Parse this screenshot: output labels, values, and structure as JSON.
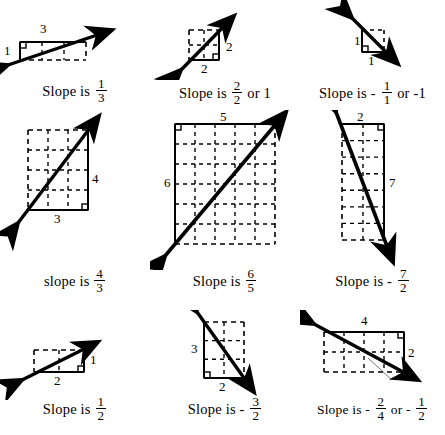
{
  "figures": [
    {
      "id": "slope-one-third",
      "caption_prefix": "Slope is",
      "sign": "",
      "numerator": "1",
      "denominator": "3",
      "alt_text": "",
      "rise_label": "1",
      "run_label": "3",
      "rise": 1,
      "run": 3,
      "direction": "positive",
      "grid_cols": 3,
      "grid_rows": 1
    },
    {
      "id": "slope-two-over-two",
      "caption_prefix": "Slope is",
      "sign": "",
      "numerator": "2",
      "denominator": "2",
      "alt_text": "or  1",
      "rise_label": "2",
      "run_label": "2",
      "rise": 2,
      "run": 2,
      "direction": "positive",
      "grid_cols": 2,
      "grid_rows": 2
    },
    {
      "id": "slope-negative-one",
      "caption_prefix": "Slope is",
      "sign": "-",
      "numerator": "1",
      "denominator": "1",
      "alt_text": "or  -1",
      "rise_label": "1",
      "run_label": "1",
      "rise": 1,
      "run": 1,
      "direction": "negative",
      "grid_cols": 1,
      "grid_rows": 1
    },
    {
      "id": "slope-four-thirds",
      "caption_prefix": "slope is",
      "sign": "",
      "numerator": "4",
      "denominator": "3",
      "alt_text": "",
      "rise_label": "4",
      "run_label": "3",
      "rise": 4,
      "run": 3,
      "direction": "positive",
      "grid_cols": 3,
      "grid_rows": 4
    },
    {
      "id": "slope-six-fifths",
      "caption_prefix": "Slope is",
      "sign": "",
      "numerator": "6",
      "denominator": "5",
      "alt_text": "",
      "rise_label": "6",
      "run_label": "5",
      "rise": 6,
      "run": 5,
      "direction": "positive",
      "grid_cols": 5,
      "grid_rows": 6
    },
    {
      "id": "slope-negative-seven-halves",
      "caption_prefix": "Slope is",
      "sign": "-",
      "numerator": "7",
      "denominator": "2",
      "alt_text": "",
      "rise_label": "7",
      "run_label": "2",
      "rise": 7,
      "run": 2,
      "direction": "negative",
      "grid_cols": 2,
      "grid_rows": 7
    },
    {
      "id": "slope-one-half",
      "caption_prefix": "Slope is",
      "sign": "",
      "numerator": "1",
      "denominator": "2",
      "alt_text": "",
      "rise_label": "1",
      "run_label": "2",
      "rise": 1,
      "run": 2,
      "direction": "positive",
      "grid_cols": 2,
      "grid_rows": 1
    },
    {
      "id": "slope-negative-three-halves",
      "caption_prefix": "Slope is",
      "sign": "-",
      "numerator": "3",
      "denominator": "2",
      "alt_text": "",
      "rise_label": "3",
      "run_label": "2",
      "rise": 3,
      "run": 2,
      "direction": "negative",
      "grid_cols": 2,
      "grid_rows": 3
    },
    {
      "id": "slope-negative-two-fourths",
      "caption_prefix": "Slope is",
      "sign": "-",
      "numerator": "2",
      "denominator": "4",
      "alt_text": "or",
      "alt_sign": "-",
      "alt_numerator": "1",
      "alt_denominator": "2",
      "rise_label": "2",
      "run_label": "4",
      "rise": 2,
      "run": 4,
      "direction": "negative",
      "grid_cols": 4,
      "grid_rows": 2
    }
  ],
  "colors": {
    "ink": "#000000",
    "paper": "#ffffff"
  }
}
